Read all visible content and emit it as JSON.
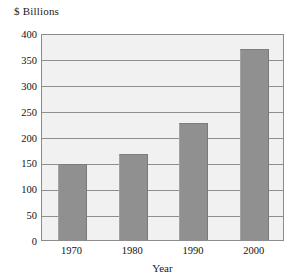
{
  "chart_data": {
    "type": "bar",
    "title": "",
    "unit_label": "$ Billions",
    "xlabel": "Year",
    "ylabel": "$ Billions",
    "categories": [
      "1970",
      "1980",
      "1990",
      "2000"
    ],
    "values": [
      147,
      167,
      226,
      370
    ],
    "ylim": [
      0,
      400
    ],
    "yticks": [
      "0",
      "50",
      "100",
      "150",
      "200",
      "250",
      "300",
      "350",
      "400"
    ],
    "ytick_values": [
      0,
      50,
      100,
      150,
      200,
      250,
      300,
      350,
      400
    ],
    "grid": true,
    "legend": "none",
    "colors": {
      "bar_fill": "#909090",
      "plot_background": "#f1f1f1",
      "gridline": "#8e8e8e",
      "frame": "#8c8c8c",
      "text": "#111111",
      "page_background": "#ffffff"
    }
  }
}
